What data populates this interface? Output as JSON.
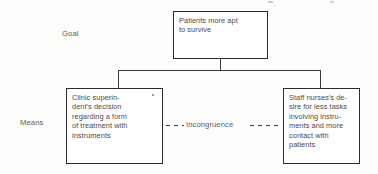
{
  "diagram": {
    "row_labels": {
      "goal": "Goal",
      "means": "Means"
    },
    "nodes": {
      "goal": {
        "text": "Patients more apt\nto survive"
      },
      "means_left": {
        "text": "Clinic superin-\ndent's decision\nregarding a form\nof treatment with\ninstruments"
      },
      "means_right": {
        "text": "Staff nurses's de-\nsire for less tasks\ninvolving instru-\nments and more\ncontact with\npatients"
      }
    },
    "link": {
      "label": "Incongruence",
      "style": "dashed"
    },
    "colors": {
      "box_border": "#2b2b2b",
      "text": "#4a4a4a",
      "connector": "#3a3a3a",
      "background": "#fdfdfc"
    }
  }
}
